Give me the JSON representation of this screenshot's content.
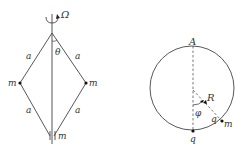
{
  "figure_left": {
    "labels": {
      "omega": "Ω",
      "theta": "θ",
      "rod_upper_left": "a",
      "rod_upper_right": "a",
      "rod_lower_left": "a",
      "rod_lower_right": "a",
      "mass_left": "m",
      "mass_right": "m",
      "mass_bottom": "m"
    }
  },
  "figure_right": {
    "labels": {
      "top_point": "A",
      "radius": "R",
      "angle": "φ",
      "bead_charge": "q",
      "bead_mass": "m",
      "bottom_charge": "q"
    }
  },
  "colors": {
    "line": "#333333",
    "background": "#ffffff"
  }
}
